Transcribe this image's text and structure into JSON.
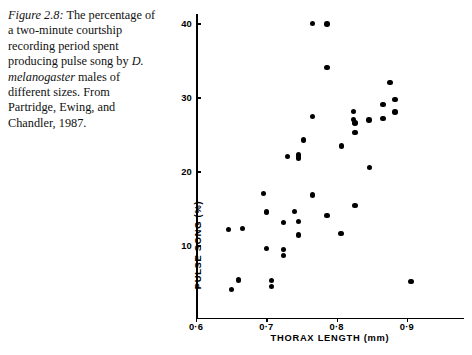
{
  "caption": {
    "figure_label": "Figure 2.8:",
    "text": " The percentage of a two-minute courtship recording period spent producing pulse song by ",
    "species": "D. melanogaster",
    "text_end": " males of different sizes. From Partridge, Ewing, and Chandler, 1987."
  },
  "chart_data": {
    "type": "scatter",
    "title": "",
    "xlabel": "THORAX LENGTH (mm)",
    "ylabel": "PULSE SONG (%)",
    "xlim": [
      0.6,
      0.96
    ],
    "ylim": [
      0,
      41.5
    ],
    "grid": false,
    "legend": "none",
    "marker_color": "#000000",
    "xticks": [
      0.6,
      0.7,
      0.8,
      0.9
    ],
    "xtick_labels": [
      "0·6",
      "0·7",
      "0·8",
      "0·9"
    ],
    "yticks": [
      10,
      20,
      30,
      40
    ],
    "ytick_labels": [
      "10",
      "20",
      "30",
      "40"
    ],
    "points": [
      {
        "x": 0.766,
        "y": 40.0
      },
      {
        "x": 0.786,
        "y": 39.9
      },
      {
        "x": 0.786,
        "y": 34.0
      },
      {
        "x": 0.876,
        "y": 32.0
      },
      {
        "x": 0.766,
        "y": 27.4
      },
      {
        "x": 0.824,
        "y": 28.1
      },
      {
        "x": 0.866,
        "y": 29.0
      },
      {
        "x": 0.883,
        "y": 29.7
      },
      {
        "x": 0.824,
        "y": 27.0
      },
      {
        "x": 0.883,
        "y": 28.0
      },
      {
        "x": 0.866,
        "y": 27.1
      },
      {
        "x": 0.826,
        "y": 26.5
      },
      {
        "x": 0.846,
        "y": 26.9
      },
      {
        "x": 0.826,
        "y": 25.2
      },
      {
        "x": 0.807,
        "y": 23.4
      },
      {
        "x": 0.753,
        "y": 24.2
      },
      {
        "x": 0.746,
        "y": 22.2
      },
      {
        "x": 0.73,
        "y": 22.0
      },
      {
        "x": 0.746,
        "y": 21.8
      },
      {
        "x": 0.847,
        "y": 20.5
      },
      {
        "x": 0.696,
        "y": 17.0
      },
      {
        "x": 0.766,
        "y": 16.8
      },
      {
        "x": 0.826,
        "y": 15.4
      },
      {
        "x": 0.7,
        "y": 14.5
      },
      {
        "x": 0.74,
        "y": 14.6
      },
      {
        "x": 0.786,
        "y": 14.0
      },
      {
        "x": 0.646,
        "y": 12.1
      },
      {
        "x": 0.666,
        "y": 12.3
      },
      {
        "x": 0.724,
        "y": 13.1
      },
      {
        "x": 0.746,
        "y": 13.2
      },
      {
        "x": 0.746,
        "y": 11.4
      },
      {
        "x": 0.806,
        "y": 11.6
      },
      {
        "x": 0.7,
        "y": 9.6
      },
      {
        "x": 0.724,
        "y": 9.4
      },
      {
        "x": 0.724,
        "y": 8.6
      },
      {
        "x": 0.906,
        "y": 5.1
      },
      {
        "x": 0.66,
        "y": 5.3
      },
      {
        "x": 0.707,
        "y": 5.2
      },
      {
        "x": 0.707,
        "y": 4.4
      },
      {
        "x": 0.65,
        "y": 4.0
      }
    ]
  }
}
